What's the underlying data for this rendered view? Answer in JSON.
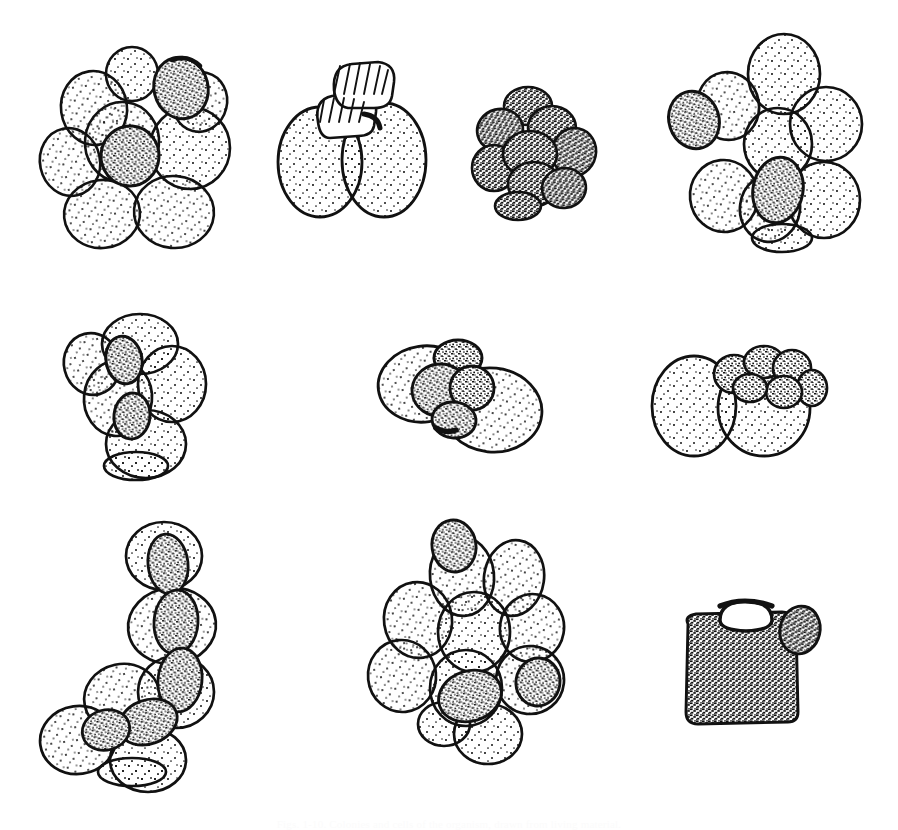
{
  "plate": {
    "title": "Plate of cell-cluster line drawings",
    "background_color": "#ffffff",
    "ink_color": "#111111",
    "stipple_color": "#1a1a1a",
    "width": 898,
    "height": 829,
    "technique": "pen-and-ink stipple line drawing",
    "caption": "Figs. 1-10. Colonies and cells of the organism, drawn from living material."
  },
  "rows": [
    {
      "name": "top-row",
      "top": 20,
      "height": 260
    },
    {
      "name": "middle-row",
      "top": 300,
      "height": 190
    },
    {
      "name": "bottom-row",
      "top": 500,
      "height": 290
    }
  ],
  "specimens": [
    {
      "id": 1,
      "label": "Fig. 1",
      "row": "top-row",
      "description": "Dense rosette cluster of about ten pale stippled ovoid cells with two dark granular cells, one upper-right and one near the centre",
      "x": 22,
      "y": 30,
      "w": 240,
      "h": 222,
      "cell_count": 10,
      "dark_cell_count": 2,
      "texture": "fine-stipple"
    },
    {
      "id": 2,
      "label": "Fig. 2",
      "row": "top-row",
      "description": "Two large pale ovoid cells joined side by side, surmounted by a pair of stacked ribbed or striated cap segments",
      "x": 272,
      "y": 52,
      "w": 158,
      "h": 170,
      "cell_count": 2,
      "dark_cell_count": 0,
      "texture": "fine-stipple with striated cap"
    },
    {
      "id": 3,
      "label": "Fig. 3",
      "row": "top-row",
      "description": "Compact mulberry-like aggregate of small, uniformly coarse-granular cells",
      "x": 470,
      "y": 84,
      "w": 132,
      "h": 134,
      "cell_count": 9,
      "dark_cell_count": 9,
      "texture": "coarse-granular"
    },
    {
      "id": 4,
      "label": "Fig. 4",
      "row": "top-row",
      "description": "Loose rosette of eight pale rounded cells with two coarse granular cells at left and lower centre",
      "x": 666,
      "y": 32,
      "w": 200,
      "h": 215,
      "cell_count": 8,
      "dark_cell_count": 2,
      "texture": "fine-stipple"
    },
    {
      "id": 5,
      "label": "Fig. 5",
      "row": "middle-row",
      "description": "Vertically elongated cluster of six pale cells enclosing two small dark granular cells in a column",
      "x": 62,
      "y": 312,
      "w": 158,
      "h": 168,
      "cell_count": 6,
      "dark_cell_count": 2,
      "texture": "fine-stipple"
    },
    {
      "id": 6,
      "label": "Fig. 6",
      "row": "middle-row",
      "description": "Two large overlapping pale cells with a dark granular three-lobed mass wedged between them",
      "x": 374,
      "y": 332,
      "w": 176,
      "h": 128,
      "cell_count": 2,
      "dark_cell_count": 3,
      "texture": "fine-stipple"
    },
    {
      "id": 7,
      "label": "Fig. 7",
      "row": "middle-row",
      "description": "Two large pale ovoid cells bearing a crown of small granular bud-cells along the upper right margin",
      "x": 646,
      "y": 344,
      "w": 182,
      "h": 116,
      "cell_count": 2,
      "dark_cell_count": 6,
      "texture": "fine-stipple"
    },
    {
      "id": 8,
      "label": "Fig. 8",
      "row": "bottom-row",
      "description": "L-shaped chain of pale cells strung along a continuous dark granular axis running from top right down to lower left",
      "x": 36,
      "y": 516,
      "w": 192,
      "h": 272,
      "cell_count": 9,
      "dark_cell_count": 5,
      "texture": "fine-stipple with granular axis"
    },
    {
      "id": 9,
      "label": "Fig. 9",
      "row": "bottom-row",
      "description": "Large rosette of about eleven pale stippled cells with three dark granular cells at top, centre-low and right",
      "x": 366,
      "y": 516,
      "w": 214,
      "h": 248,
      "cell_count": 11,
      "dark_cell_count": 3,
      "texture": "fine-stipple"
    },
    {
      "id": 10,
      "label": "Fig. 10",
      "row": "bottom-row",
      "description": "Single squarish densely granular body with an open collar or neck at the top and a small rounded bud on the upper right shoulder",
      "x": 672,
      "y": 588,
      "w": 152,
      "h": 152,
      "cell_count": 1,
      "dark_cell_count": 1,
      "texture": "dense-granular"
    }
  ]
}
